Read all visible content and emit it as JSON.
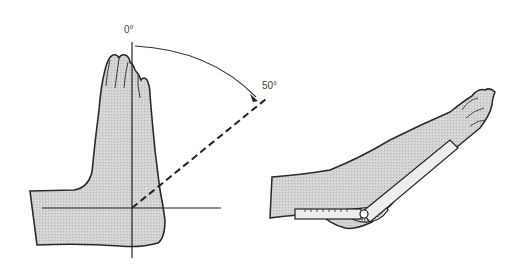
{
  "figure": {
    "left_panel": {
      "angle_start_label": "0°",
      "angle_end_label": "50°"
    },
    "right_panel": {
      "instrument": "goniometer"
    }
  },
  "colors": {
    "skin_fill": "#cfcfcf",
    "outline": "#2a2a2a",
    "goniometer_fill": "#ededed",
    "background": "#ffffff"
  }
}
